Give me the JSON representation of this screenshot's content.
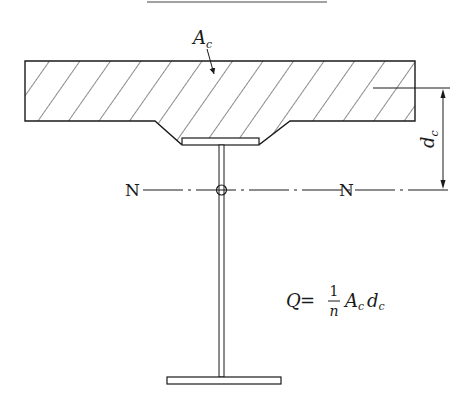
{
  "diagram": {
    "type": "composite-beam-cross-section",
    "top_rule": {
      "present": true
    },
    "labels": {
      "concrete_area": "A",
      "concrete_area_sub": "c",
      "neutral_axis_left": "N",
      "neutral_axis_right": "N",
      "distance": "d",
      "distance_sub": "c"
    },
    "formula": {
      "lhs": "Q",
      "equals": "=",
      "numerator": "1",
      "denominator": "n",
      "term1": "A",
      "term1_sub": "c",
      "term2": "d",
      "term2_sub": "c"
    },
    "colors": {
      "stroke": "#1a1a1a",
      "background": "#ffffff"
    }
  }
}
